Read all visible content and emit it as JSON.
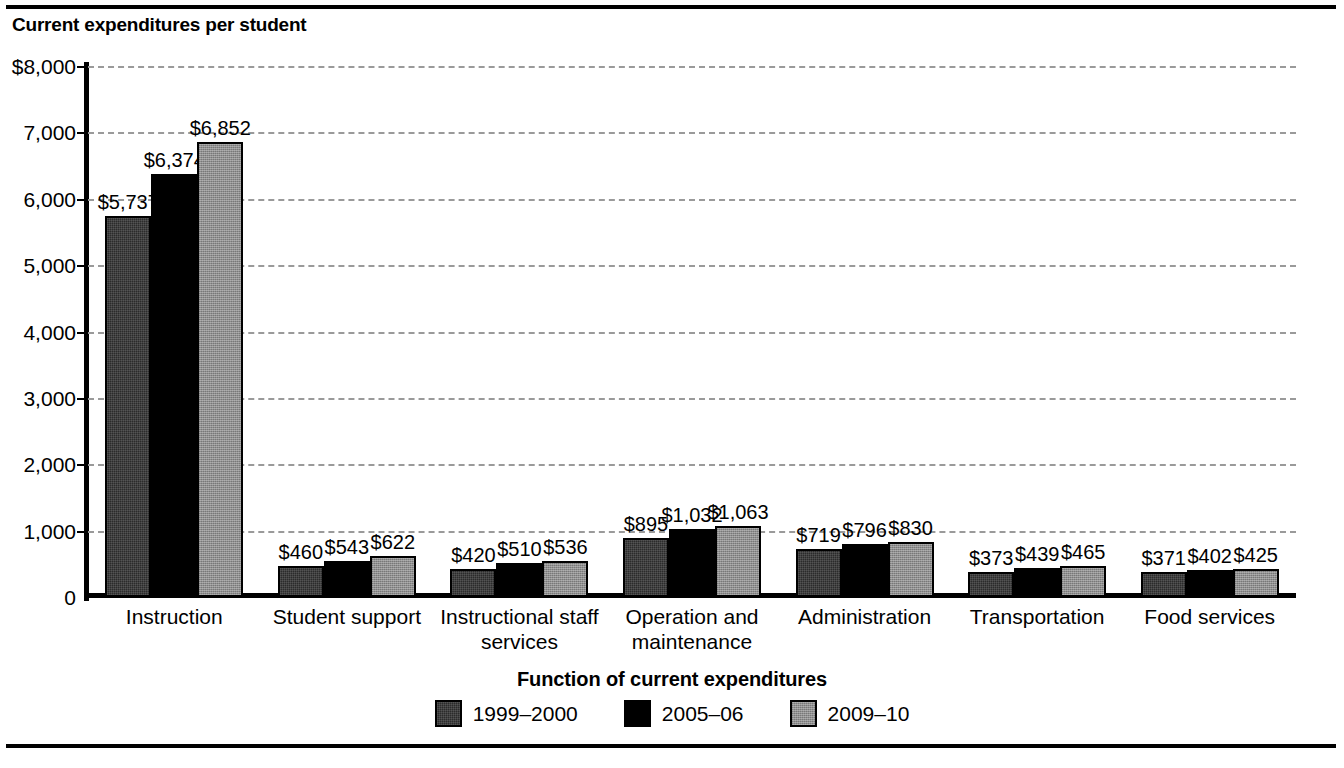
{
  "figure": {
    "title": "Current expenditures per student"
  },
  "chart_data": {
    "type": "bar",
    "title": "Current expenditures per student",
    "xlabel": "Function of current expenditures",
    "ylabel": "Current expenditures per student",
    "ylim": [
      0,
      8000
    ],
    "grid": true,
    "legend_position": "bottom",
    "ytick_labels": [
      "$8,000",
      "7,000",
      "6,000",
      "5,000",
      "4,000",
      "3,000",
      "2,000",
      "1,000",
      "0"
    ],
    "ytick_values": [
      8000,
      7000,
      6000,
      5000,
      4000,
      3000,
      2000,
      1000,
      0
    ],
    "categories": [
      "Instruction",
      "Student support",
      "Instructional staff\nservices",
      "Operation and\nmaintenance",
      "Administration",
      "Transportation",
      "Food services"
    ],
    "series": [
      {
        "name": "1999–2000",
        "color": "#2b2b2b",
        "values": [
          5737,
          460,
          420,
          895,
          719,
          373,
          371
        ],
        "labels": [
          "$5,737",
          "$460",
          "$420",
          "$895",
          "$719",
          "$373",
          "$371"
        ]
      },
      {
        "name": "2005–06",
        "color": "#000000",
        "values": [
          6374,
          543,
          510,
          1032,
          796,
          439,
          402
        ],
        "labels": [
          "$6,374",
          "$543",
          "$510",
          "$1,032",
          "$796",
          "$439",
          "$402"
        ]
      },
      {
        "name": "2009–10",
        "color": "#8f8f8f",
        "values": [
          6852,
          622,
          536,
          1063,
          830,
          465,
          425
        ],
        "labels": [
          "$6,852",
          "$622",
          "$536",
          "$1,063",
          "$830",
          "$465",
          "$425"
        ]
      }
    ]
  },
  "legend": {
    "items": [
      {
        "label": "1999–2000",
        "swatch": "s0"
      },
      {
        "label": "2005–06",
        "swatch": "s1"
      },
      {
        "label": "2009–10",
        "swatch": "s2"
      }
    ]
  }
}
